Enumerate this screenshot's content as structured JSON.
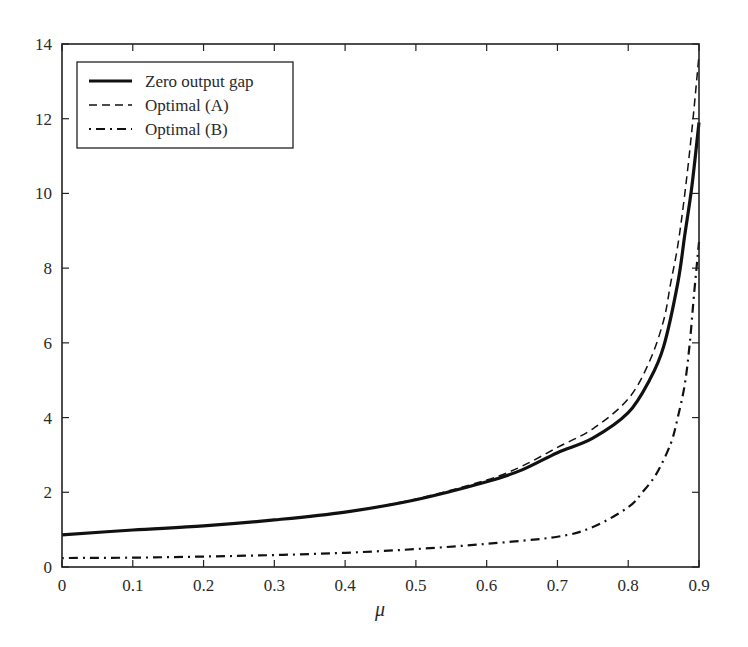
{
  "chart_data": {
    "type": "line",
    "title": "",
    "xlabel": "μ",
    "ylabel": "",
    "xlim": [
      0,
      0.9
    ],
    "ylim": [
      0,
      14
    ],
    "grid": false,
    "legend_position": "upper-left",
    "x_ticks": [
      "0",
      "0.1",
      "0.2",
      "0.3",
      "0.4",
      "0.5",
      "0.6",
      "0.7",
      "0.8",
      "0.9"
    ],
    "y_ticks": [
      "0",
      "2",
      "4",
      "6",
      "8",
      "10",
      "12",
      "14"
    ],
    "series": [
      {
        "name": "Zero output gap",
        "style": "solid",
        "x": [
          0,
          0.1,
          0.2,
          0.3,
          0.4,
          0.5,
          0.6,
          0.65,
          0.7,
          0.75,
          0.8,
          0.83,
          0.85,
          0.87,
          0.88,
          0.89,
          0.9
        ],
        "y": [
          0.86,
          0.99,
          1.1,
          1.26,
          1.47,
          1.8,
          2.28,
          2.6,
          3.06,
          3.45,
          4.13,
          5.0,
          5.9,
          7.6,
          8.9,
          10.2,
          11.9
        ]
      },
      {
        "name": "Optimal (A)",
        "style": "dashed",
        "x": [
          0,
          0.1,
          0.2,
          0.3,
          0.4,
          0.5,
          0.6,
          0.65,
          0.7,
          0.75,
          0.8,
          0.83,
          0.85,
          0.86,
          0.87,
          0.88,
          0.89,
          0.9
        ],
        "y": [
          0.86,
          0.99,
          1.1,
          1.26,
          1.47,
          1.82,
          2.33,
          2.7,
          3.2,
          3.7,
          4.5,
          5.5,
          6.6,
          7.6,
          8.6,
          10.0,
          11.7,
          13.7
        ]
      },
      {
        "name": "Optimal (B)",
        "style": "dashdot",
        "x": [
          0,
          0.1,
          0.2,
          0.3,
          0.4,
          0.5,
          0.6,
          0.7,
          0.75,
          0.8,
          0.82,
          0.84,
          0.86,
          0.87,
          0.88,
          0.887,
          0.893,
          0.9
        ],
        "y": [
          0.24,
          0.25,
          0.28,
          0.32,
          0.38,
          0.48,
          0.62,
          0.81,
          1.07,
          1.6,
          2.0,
          2.5,
          3.3,
          4.0,
          4.9,
          6.0,
          7.3,
          8.7
        ]
      }
    ]
  },
  "legend": {
    "items": [
      "Zero output gap",
      "Optimal (A)",
      "Optimal (B)"
    ]
  },
  "axes": {
    "x_label": "μ"
  }
}
